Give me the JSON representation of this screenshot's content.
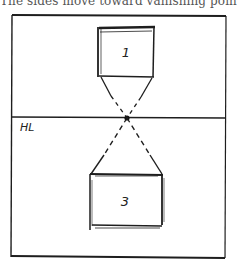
{
  "caption": "The sides move toward vanishing point.",
  "diagram": {
    "type": "one-point-perspective-sketch",
    "horizon_label": "HL",
    "boxes": [
      {
        "label": "1",
        "position": "above horizon"
      },
      {
        "label": "3",
        "position": "below horizon"
      }
    ],
    "vanishing_point": "dot on horizon line",
    "colors": {
      "ink": "#1e1e1e",
      "background": "#ffffff"
    }
  }
}
